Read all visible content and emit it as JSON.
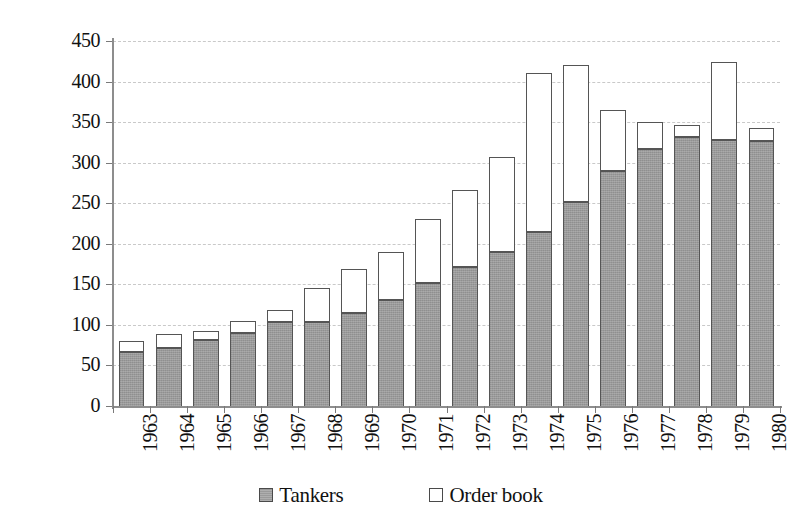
{
  "chart_data": {
    "type": "bar",
    "stacked": true,
    "title": "",
    "subtitle": "",
    "xlabel": "",
    "ylabel": "",
    "ylim": [
      0,
      450
    ],
    "ytick_step": 50,
    "yticks": [
      0,
      50,
      100,
      150,
      200,
      250,
      300,
      350,
      400,
      450
    ],
    "ytick_labels": [
      "0",
      "50",
      "100",
      "150",
      "200",
      "250",
      "300",
      "350",
      "400",
      "450"
    ],
    "grid": true,
    "grid_axis": "y",
    "grid_style": "dashed",
    "legend_position": "bottom",
    "categories": [
      "1963",
      "1964",
      "1965",
      "1966",
      "1967",
      "1968",
      "1969",
      "1970",
      "1971",
      "1972",
      "1973",
      "1974",
      "1975",
      "1976",
      "1977",
      "1978",
      "1979",
      "1980"
    ],
    "series": [
      {
        "name": "Tankers",
        "color": "#9a9a9a",
        "values": [
          67,
          71,
          82,
          90,
          104,
          104,
          115,
          131,
          152,
          172,
          190,
          215,
          251,
          290,
          317,
          332,
          328,
          327
        ]
      },
      {
        "name": "Order book",
        "color": "#ffffff",
        "values": [
          13,
          18,
          11,
          15,
          15,
          41,
          54,
          59,
          79,
          94,
          117,
          195,
          170,
          75,
          33,
          14,
          96,
          16
        ]
      }
    ],
    "totals": [
      80,
      89,
      93,
      105,
      119,
      145,
      169,
      190,
      231,
      266,
      307,
      410,
      421,
      365,
      350,
      346,
      424,
      343
    ],
    "annotations": []
  },
  "legend": {
    "items": [
      {
        "label": "Tankers",
        "swatch": "filled-gray-square"
      },
      {
        "label": "Order book",
        "swatch": "empty-white-square"
      }
    ]
  },
  "colors": {
    "tankers_fill": "#9a9a9a",
    "order_fill": "#ffffff",
    "bar_border": "#555555",
    "axis": "#8d8d8d",
    "gridline": "#c9c9c9",
    "text": "#111111",
    "background": "#ffffff"
  }
}
